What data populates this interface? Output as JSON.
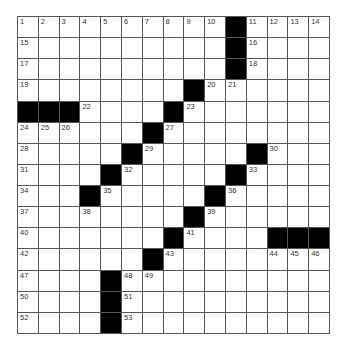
{
  "puzzle": {
    "rows": 15,
    "cols": 15,
    "colors": {
      "black": "#000000",
      "white": "#ffffff",
      "line": "#555555"
    },
    "grid": [
      "..........#....",
      "..........#....",
      "..........#....",
      "........#......",
      "###....#.......",
      "......#........",
      ".....#.....#...",
      "....#.....#....",
      "...#.....#.....",
      "........#......",
      ".......#....###",
      "......#........",
      "....#..........",
      "....#..........",
      "....#.........."
    ],
    "numbers": [
      {
        "r": 0,
        "c": 0,
        "n": "1"
      },
      {
        "r": 0,
        "c": 1,
        "n": "2"
      },
      {
        "r": 0,
        "c": 2,
        "n": "3"
      },
      {
        "r": 0,
        "c": 3,
        "n": "4"
      },
      {
        "r": 0,
        "c": 4,
        "n": "5"
      },
      {
        "r": 0,
        "c": 5,
        "n": "6"
      },
      {
        "r": 0,
        "c": 6,
        "n": "7"
      },
      {
        "r": 0,
        "c": 7,
        "n": "8"
      },
      {
        "r": 0,
        "c": 8,
        "n": "9"
      },
      {
        "r": 0,
        "c": 9,
        "n": "10"
      },
      {
        "r": 0,
        "c": 11,
        "n": "11"
      },
      {
        "r": 0,
        "c": 12,
        "n": "12"
      },
      {
        "r": 0,
        "c": 13,
        "n": "13"
      },
      {
        "r": 0,
        "c": 14,
        "n": "14"
      },
      {
        "r": 1,
        "c": 0,
        "n": "15"
      },
      {
        "r": 1,
        "c": 11,
        "n": "16"
      },
      {
        "r": 2,
        "c": 0,
        "n": "17"
      },
      {
        "r": 2,
        "c": 11,
        "n": "18"
      },
      {
        "r": 3,
        "c": 0,
        "n": "19"
      },
      {
        "r": 3,
        "c": 9,
        "n": "20"
      },
      {
        "r": 3,
        "c": 10,
        "n": "21"
      },
      {
        "r": 4,
        "c": 3,
        "n": "22"
      },
      {
        "r": 4,
        "c": 8,
        "n": "23"
      },
      {
        "r": 5,
        "c": 0,
        "n": "24"
      },
      {
        "r": 5,
        "c": 1,
        "n": "25"
      },
      {
        "r": 5,
        "c": 2,
        "n": "26"
      },
      {
        "r": 5,
        "c": 7,
        "n": "27"
      },
      {
        "r": 6,
        "c": 0,
        "n": "28"
      },
      {
        "r": 6,
        "c": 6,
        "n": "29"
      },
      {
        "r": 6,
        "c": 12,
        "n": "30"
      },
      {
        "r": 7,
        "c": 0,
        "n": "31"
      },
      {
        "r": 7,
        "c": 5,
        "n": "32"
      },
      {
        "r": 7,
        "c": 11,
        "n": "33"
      },
      {
        "r": 8,
        "c": 0,
        "n": "34"
      },
      {
        "r": 8,
        "c": 4,
        "n": "35"
      },
      {
        "r": 8,
        "c": 10,
        "n": "36"
      },
      {
        "r": 9,
        "c": 0,
        "n": "37"
      },
      {
        "r": 9,
        "c": 3,
        "n": "38"
      },
      {
        "r": 9,
        "c": 9,
        "n": "39"
      },
      {
        "r": 10,
        "c": 0,
        "n": "40"
      },
      {
        "r": 10,
        "c": 8,
        "n": "41"
      },
      {
        "r": 11,
        "c": 0,
        "n": "42"
      },
      {
        "r": 11,
        "c": 7,
        "n": "43"
      },
      {
        "r": 11,
        "c": 12,
        "n": "44"
      },
      {
        "r": 11,
        "c": 13,
        "n": "45"
      },
      {
        "r": 11,
        "c": 14,
        "n": "46"
      },
      {
        "r": 12,
        "c": 0,
        "n": "47"
      },
      {
        "r": 12,
        "c": 5,
        "n": "48"
      },
      {
        "r": 12,
        "c": 6,
        "n": "49"
      },
      {
        "r": 13,
        "c": 0,
        "n": "50"
      },
      {
        "r": 13,
        "c": 5,
        "n": "51"
      },
      {
        "r": 14,
        "c": 0,
        "n": "52"
      },
      {
        "r": 14,
        "c": 5,
        "n": "53"
      }
    ]
  }
}
